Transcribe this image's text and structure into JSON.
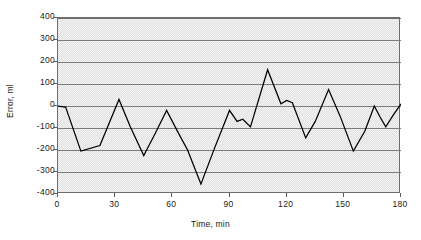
{
  "chart_data": {
    "type": "line",
    "title": "",
    "xlabel": "Time, min",
    "ylabel": "Error, ml",
    "xlim": [
      0,
      180
    ],
    "ylim": [
      -400,
      400
    ],
    "xticks": [
      0,
      30,
      60,
      90,
      120,
      150,
      180
    ],
    "yticks": [
      400,
      300,
      200,
      100,
      0,
      -100,
      -200,
      -300,
      -400
    ],
    "grid": "horizontal",
    "legend": "none",
    "series": [
      {
        "name": "Error",
        "color": "#000000",
        "x": [
          0,
          4,
          12,
          22,
          32,
          38,
          45,
          51,
          57,
          63,
          68,
          75,
          82,
          90,
          94,
          97,
          101,
          110,
          117,
          120,
          123,
          130,
          135,
          142,
          148,
          155,
          161,
          166,
          169,
          172,
          176,
          180
        ],
        "y": [
          0,
          -5,
          -205,
          -180,
          30,
          -95,
          -225,
          -125,
          -20,
          -120,
          -200,
          -355,
          -195,
          -20,
          -70,
          -60,
          -95,
          165,
          10,
          25,
          15,
          -145,
          -70,
          75,
          -45,
          -205,
          -115,
          0,
          -50,
          -95,
          -40,
          10
        ]
      }
    ]
  },
  "axes": {
    "ytick_labels": [
      "400",
      "300",
      "200",
      "100",
      "0",
      "-100",
      "-200",
      "-300",
      "-400"
    ],
    "xtick_labels": [
      "0",
      "30",
      "60",
      "90",
      "120",
      "150",
      "180"
    ]
  }
}
